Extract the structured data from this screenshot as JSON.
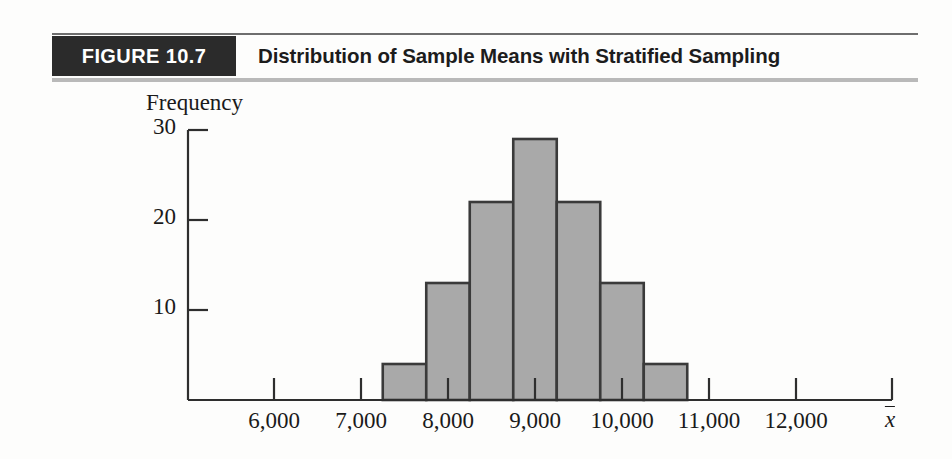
{
  "header": {
    "figure_tag": "FIGURE 10.7",
    "title": "Distribution of Sample Means with Stratified Sampling"
  },
  "chart_data": {
    "type": "bar",
    "title": "Distribution of Sample Means with Stratified Sampling",
    "xlabel": "x̄",
    "ylabel": "Frequency",
    "grid": false,
    "legend": null,
    "xlim": [
      5500,
      12600
    ],
    "ylim": [
      0,
      30
    ],
    "ytick_labels": [
      "10",
      "20",
      "30"
    ],
    "ytick_values": [
      10,
      20,
      30
    ],
    "xtick_labels": [
      "6,000",
      "7,000",
      "8,000",
      "9,000",
      "10,000",
      "11,000",
      "12,000"
    ],
    "xtick_values": [
      6000,
      7000,
      8000,
      9000,
      10000,
      11000,
      12000
    ],
    "bin_width": 500,
    "bins": [
      {
        "start": 7250,
        "end": 7750,
        "center": 7500,
        "value": 4
      },
      {
        "start": 7750,
        "end": 8250,
        "center": 8000,
        "value": 13
      },
      {
        "start": 8250,
        "end": 8750,
        "center": 8500,
        "value": 22
      },
      {
        "start": 8750,
        "end": 9250,
        "center": 9000,
        "value": 29
      },
      {
        "start": 9250,
        "end": 9750,
        "center": 9500,
        "value": 22
      },
      {
        "start": 9750,
        "end": 10250,
        "center": 10000,
        "value": 13
      },
      {
        "start": 10250,
        "end": 10750,
        "center": 10500,
        "value": 4
      }
    ],
    "categories": [
      "7,500",
      "8,000",
      "8,500",
      "9,000",
      "9,500",
      "10,000",
      "10,500"
    ],
    "values": [
      4,
      13,
      22,
      29,
      22,
      13,
      4
    ],
    "colors": {
      "bar_fill": "#a9a9a9",
      "bar_edge": "#3a3a3a",
      "axis": "#2e2e2e",
      "text": "#1a1a1a",
      "tag_background": "#2b2b2b",
      "tag_text": "#ffffff"
    }
  }
}
